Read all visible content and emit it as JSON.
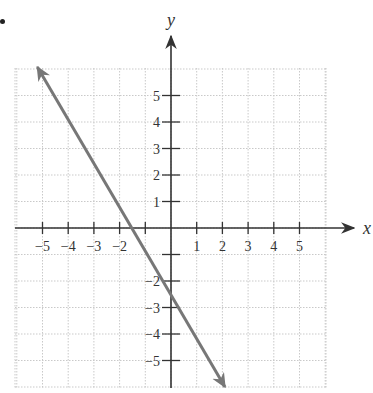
{
  "chart_data": {
    "type": "line",
    "title": "",
    "xlabel": "x",
    "ylabel": "y",
    "xlim": [
      -6,
      6
    ],
    "ylim": [
      -6,
      6
    ],
    "grid": true,
    "x_ticks": [
      -5,
      -4,
      -3,
      -2,
      -1,
      1,
      2,
      3,
      4,
      5
    ],
    "x_tick_labels": [
      "−5",
      "−4",
      "−3",
      "−2",
      "",
      "1",
      "2",
      "3",
      "4",
      "5"
    ],
    "y_ticks": [
      5,
      4,
      3,
      2,
      1,
      -1,
      -2,
      -3,
      -4,
      -5
    ],
    "y_tick_labels": [
      "5",
      "4",
      "3",
      "2",
      "1",
      "",
      "−2",
      "−3",
      "−4",
      "−5"
    ],
    "series": [
      {
        "name": "line",
        "equation": "y = -2x - 2.5",
        "slope": -2,
        "y_intercept": -2.5,
        "x_intercept": -1.25,
        "x": [
          -5.2,
          2.1
        ],
        "y": [
          7.9,
          -6.7
        ],
        "arrows": "both",
        "color": "#777777"
      }
    ]
  },
  "labels": {
    "x_axis": "x",
    "y_axis": "y"
  },
  "colors": {
    "axis": "#333333",
    "grid": "#c9c9c9",
    "line": "#777777"
  }
}
